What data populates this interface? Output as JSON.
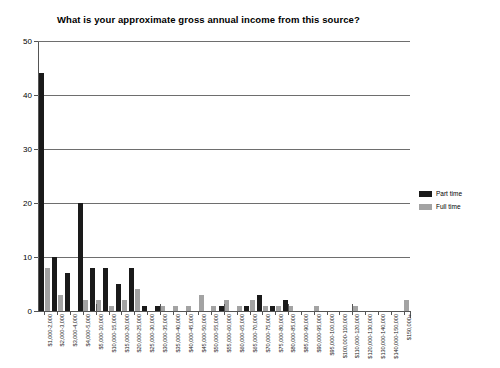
{
  "chart_data": {
    "type": "bar",
    "title": "What is your approximate gross annual income from this source?",
    "xlabel": "",
    "ylabel": "",
    "ylim": [
      0,
      50
    ],
    "yticks": [
      0,
      10,
      20,
      30,
      40,
      50
    ],
    "grid": true,
    "legend_position": "right",
    "categories": [
      "$1,000-2,000",
      "$2,000-3,000",
      "$3,000-4,000",
      "$4,000-5,000",
      "$5,000-10,000",
      "$10,000-15,000",
      "$15,000-20,000",
      "$20,000-25,000",
      "$25,000-30,000",
      "$30,000-35,000",
      "$35,000-40,000",
      "$40,000-45,000",
      "$45,000-50,000",
      "$50,000-55,000",
      "$55,000-60,000",
      "$60,000-65,000",
      "$65,000-70,000",
      "$70,000-75,000",
      "$75,000-80,000",
      "$80,000-85,000",
      "$85,000-90,000",
      "$90,000-95,000",
      "$95,000-100,000",
      "$100,000-110,000",
      "$110,000-120,000",
      "$120,000-130,000",
      "$130,000-140,000",
      "$140,000-150,000",
      "$150,000+"
    ],
    "series": [
      {
        "name": "Part time",
        "color": "#1a1a1a",
        "values": [
          44,
          10,
          7,
          20,
          8,
          8,
          5,
          8,
          1,
          1,
          0,
          0,
          0,
          0,
          1,
          0,
          1,
          3,
          1,
          2,
          0,
          0,
          0,
          0,
          0,
          0,
          0,
          0,
          0
        ]
      },
      {
        "name": "Full time",
        "color": "#a3a3a3",
        "values": [
          8,
          3,
          0,
          2,
          2,
          1,
          2,
          4,
          0,
          1,
          1,
          1,
          3,
          1,
          2,
          1,
          2,
          1,
          1,
          1,
          0,
          1,
          0,
          0,
          1,
          0,
          0,
          0,
          2
        ]
      }
    ]
  },
  "legend": {
    "items": [
      {
        "label": "Part time"
      },
      {
        "label": "Full time"
      }
    ]
  }
}
